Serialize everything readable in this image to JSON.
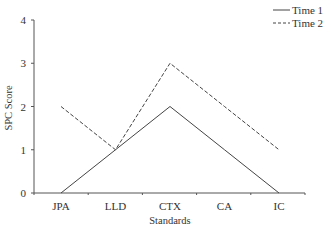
{
  "chart_data": {
    "type": "line",
    "title": "",
    "xlabel": "Standards",
    "ylabel": "SPC Score",
    "categories": [
      "JPA",
      "LLD",
      "CTX",
      "CA",
      "IC"
    ],
    "series": [
      {
        "name": "Time 1",
        "style": "solid",
        "values": [
          0,
          1,
          2,
          1,
          0
        ]
      },
      {
        "name": "Time 2",
        "style": "dashed",
        "values": [
          2,
          1,
          3,
          2,
          1
        ]
      }
    ],
    "ylim": [
      0,
      4
    ],
    "yticks": [
      0,
      1,
      2,
      3,
      4
    ],
    "grid": false,
    "legend_position": "top-right",
    "colors": {
      "line": "#444444",
      "axis": "#555555"
    }
  }
}
